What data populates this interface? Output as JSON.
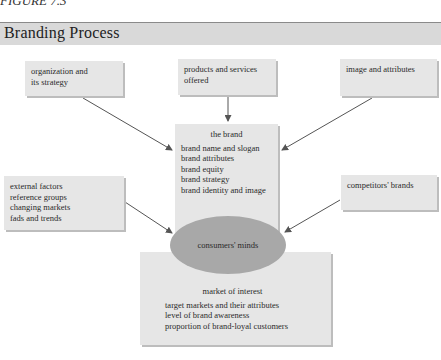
{
  "figure": {
    "label": "FIGURE 7.3",
    "title": "Branding Process"
  },
  "boxes": {
    "organization": {
      "lines": [
        "organization and",
        "its strategy"
      ]
    },
    "products": {
      "lines": [
        "products and services",
        "offered"
      ]
    },
    "image": {
      "lines": [
        "image and attributes"
      ]
    },
    "brand": {
      "heading": "the brand",
      "lines": [
        "brand name and slogan",
        "brand attributes",
        "brand equity",
        "brand strategy",
        "brand identity and image"
      ]
    },
    "external": {
      "lines": [
        "external factors",
        "reference groups",
        "changing markets",
        "fads and trends"
      ]
    },
    "competitors": {
      "lines": [
        "competitors' brands"
      ]
    },
    "market": {
      "heading": "market of interest",
      "lines": [
        "target markets and their attributes",
        "level of  brand awareness",
        "proportion of brand-loyal customers"
      ]
    }
  },
  "center": {
    "label": "consumers' minds"
  },
  "colors": {
    "box_fill": "#e6e6e6",
    "box_shadow": "#bdbdbd",
    "ellipse_fill": "#a8a8a8",
    "title_band": "#d9d9d9",
    "arrow": "#555555"
  }
}
